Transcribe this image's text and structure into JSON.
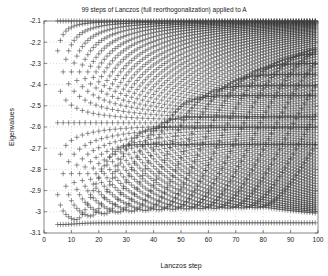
{
  "chart_data": {
    "type": "scatter",
    "title": "99 steps of Lanczos (full reorthogonalization) applied to A",
    "xlabel": "Lanczos step",
    "ylabel": "Eigenvalues",
    "xlim": [
      0,
      100
    ],
    "ylim": [
      -3.1,
      -2.1
    ],
    "xticks": [
      0,
      10,
      20,
      30,
      40,
      50,
      60,
      70,
      80,
      90,
      100
    ],
    "xtick_labels": [
      "0",
      "10",
      "20",
      "30",
      "40",
      "50",
      "60",
      "70",
      "80",
      "90",
      "100"
    ],
    "yticks": [
      -3.1,
      -3.0,
      -2.9,
      -2.8,
      -2.7,
      -2.6,
      -2.5,
      -2.4,
      -2.3,
      -2.2,
      -2.1
    ],
    "ytick_labels": [
      "-3.1",
      "-3",
      "-2.9",
      "-2.8",
      "-2.7",
      "-2.6",
      "-2.5",
      "-2.4",
      "-2.3",
      "-2.2",
      "-2.1"
    ],
    "grid": true,
    "grid_style": "dotted",
    "grid_color": "#b4b4b4",
    "marker": "+",
    "marker_color": "#3c3c3c",
    "marker_size": 2.6,
    "axes_color": "#555555",
    "background": "#ffffff",
    "legend": null,
    "steps_start": 5,
    "steps_end": 99,
    "converged_eigenvalues": [
      -3.052,
      -2.682,
      -2.601,
      -2.552,
      -2.452,
      -2.405,
      -2.352,
      -2.3,
      -2.252,
      -2.212,
      -2.178,
      -2.152,
      -2.131,
      -2.116,
      -2.105
    ],
    "spectrum_bounds": [
      -3.06,
      -2.1
    ]
  }
}
